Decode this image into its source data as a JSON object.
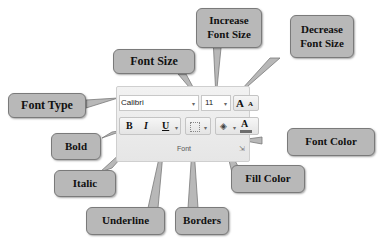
{
  "ribbon": {
    "font_name": "Calibri",
    "font_size": "11",
    "group_label": "Font",
    "increase_glyph": "A",
    "decrease_glyph": "A",
    "bold_glyph": "B",
    "italic_glyph": "I",
    "underline_glyph": "U",
    "font_color_glyph": "A",
    "dropdown_arrow": "▾",
    "launcher_glyph": "⇲"
  },
  "callouts": {
    "font_type": "Font Type",
    "font_size": "Font Size",
    "increase_font_size": "Increase Font Size",
    "decrease_font_size": "Decrease Font Size",
    "bold": "Bold",
    "italic": "Italic",
    "underline": "Underline",
    "borders": "Borders",
    "fill_color": "Fill Color",
    "font_color": "Font Color"
  },
  "colors": {
    "callout_fill": "#b8b8b8",
    "font_color_bar": "#6e6e6e"
  }
}
